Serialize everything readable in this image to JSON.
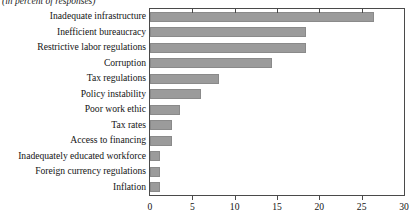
{
  "chart_data": {
    "type": "bar",
    "orientation": "horizontal",
    "title": "",
    "subtitle": "(in percent of responses)",
    "xlabel": "",
    "ylabel": "",
    "xlim": [
      0,
      30
    ],
    "xticks": [
      0,
      5,
      10,
      15,
      20,
      25,
      30
    ],
    "xtick_labels": [
      "0",
      "5",
      "10",
      "15",
      "20",
      "25",
      "30"
    ],
    "grid": false,
    "legend": null,
    "bar_color": "#9b9b9b",
    "bar_edge_color": "#8a8a8a",
    "axis_color": "#4a4a4a",
    "categories": [
      "Inadequate infrastructure",
      "Inefficient bureaucracy",
      "Restrictive labor regulations",
      "Corruption",
      "Tax regulations",
      "Policy instability",
      "Poor work ethic",
      "Tax rates",
      "Access to financing",
      "Inadequately educated workforce",
      "Foreign currency regulations",
      "Inflation"
    ],
    "values": [
      26.5,
      18.4,
      18.4,
      14.4,
      8.1,
      6.0,
      3.5,
      2.6,
      2.6,
      1.2,
      1.2,
      1.2
    ]
  }
}
